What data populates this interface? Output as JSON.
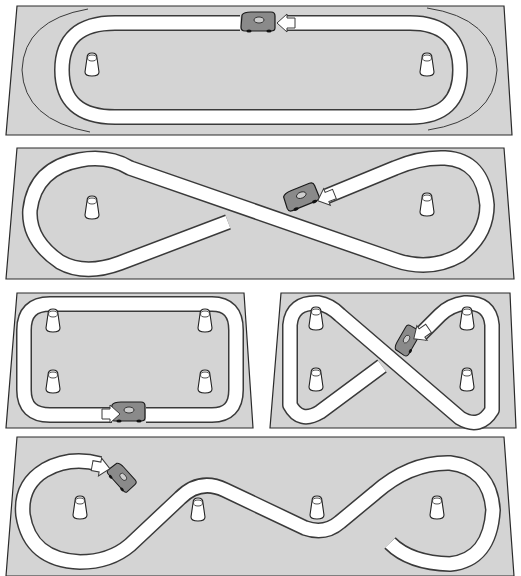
{
  "figure": {
    "title": "Toy car track layouts",
    "background_color": "#ffffff",
    "board_color": "#d4d4d4",
    "track_color": "#ffffff",
    "outline_color": "#2a2a2a"
  },
  "layouts": [
    {
      "id": "oval",
      "label": "Oval track",
      "pylons": 2,
      "car_icon": "race-car-icon",
      "direction_arrow": "arrow-left-icon",
      "extra": "outer curved guide lines at both ends"
    },
    {
      "id": "figure-eight-long",
      "label": "Long figure-eight track",
      "pylons": 2,
      "car_icon": "race-car-icon",
      "direction_arrow": "arrow-down-left-icon"
    },
    {
      "id": "rounded-rectangle",
      "label": "Rounded rectangle track",
      "pylons": 4,
      "car_icon": "race-car-icon",
      "direction_arrow": "arrow-right-icon"
    },
    {
      "id": "figure-eight-compact",
      "label": "Compact figure-eight track",
      "pylons": 4,
      "car_icon": "race-car-icon",
      "direction_arrow": "arrow-down-left-icon"
    },
    {
      "id": "slalom",
      "label": "Slalom S-curve track",
      "pylons": 4,
      "car_icon": "race-car-icon",
      "direction_arrow": "arrow-right-icon"
    }
  ]
}
